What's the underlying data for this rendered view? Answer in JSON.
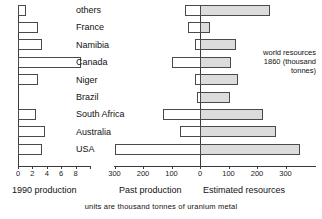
{
  "chart_data": {
    "type": "bar",
    "title": "",
    "subtitle": "",
    "caption": "units are thousand tonnes of uranium metal",
    "orientation": "horizontal",
    "layout": "back-to-back with separate left panel",
    "grid": false,
    "legend_position": "none",
    "categories": [
      "others",
      "France",
      "Namibia",
      "Canada",
      "Niger",
      "Brazil",
      "South Africa",
      "Australia",
      "USA"
    ],
    "panels": [
      {
        "name": "production-1990",
        "xlabel": "1990 production",
        "unit": "thousand tonnes",
        "xlim": [
          0,
          10
        ],
        "ticks": [
          0,
          2,
          4,
          6,
          8,
          10
        ],
        "tick_labels": [
          "0",
          "2",
          "4",
          "6",
          "8",
          ""
        ],
        "labelled_ticks": [
          0,
          2,
          4
        ],
        "series": [
          {
            "name": "1990 production",
            "style": "open",
            "values": [
              1.1,
              2.8,
              3.4,
              8.7,
              2.8,
              0.0,
              2.5,
              3.7,
              3.4
            ]
          }
        ]
      },
      {
        "name": "past-and-resources",
        "xlabel_left": "Past production",
        "xlabel_right": "Estimated resources",
        "unit": "thousand tonnes",
        "xlim": [
          -350,
          380
        ],
        "ticks": [
          -300,
          -200,
          -100,
          0,
          100,
          200,
          300
        ],
        "tick_labels": [
          "300",
          "200",
          "100",
          "0",
          "100",
          "200",
          "300"
        ],
        "series": [
          {
            "name": "Past production",
            "style": "open",
            "direction": "left",
            "values": [
              52,
              42,
              16,
              100,
              18,
              9,
              130,
              70,
              300
            ]
          },
          {
            "name": "Estimated resources",
            "style": "filled",
            "direction": "right",
            "values": [
              245,
              36,
              125,
              110,
              135,
              105,
              220,
              265,
              350
            ]
          }
        ]
      }
    ],
    "annotation": {
      "line1": "world resources",
      "line2": "1860 (thousand",
      "line3": "tonnes)"
    },
    "colors": {
      "bar_open_fill": "#ffffff",
      "bar_filled_fill": "#dcdcdc",
      "bar_stroke": "#4a4a4a",
      "axis": "#3a3a3a",
      "text": "#111111",
      "background": "#ffffff"
    }
  }
}
